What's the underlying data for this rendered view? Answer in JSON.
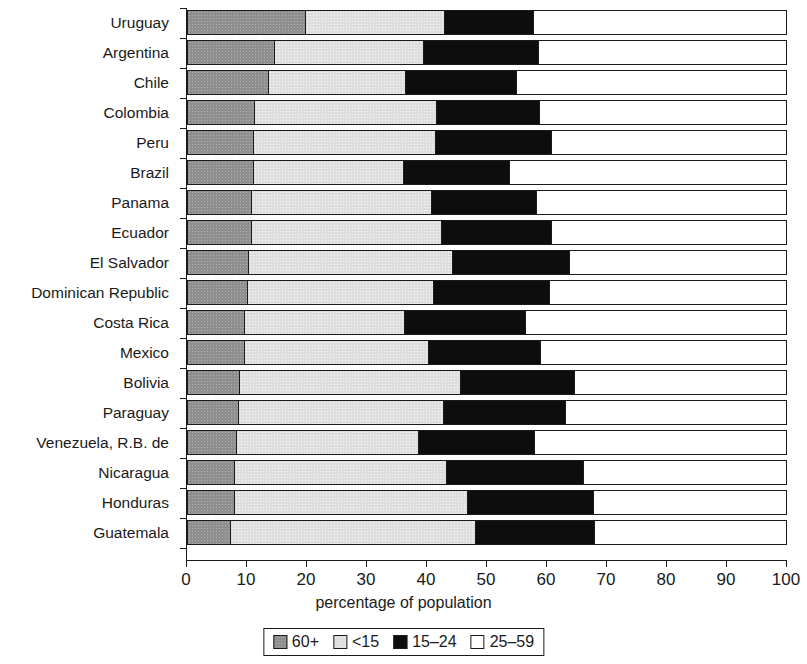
{
  "chart_data": {
    "type": "bar",
    "orientation": "horizontal",
    "stacked": true,
    "title": "",
    "xlabel": "percentage of population",
    "ylabel": "",
    "xlim": [
      0,
      100
    ],
    "xticks": [
      0,
      10,
      20,
      30,
      40,
      50,
      60,
      70,
      80,
      90,
      100
    ],
    "grid": false,
    "legend_position": "bottom",
    "categories": [
      "Uruguay",
      "Argentina",
      "Chile",
      "Colombia",
      "Peru",
      "Brazil",
      "Panama",
      "Ecuador",
      "El Salvador",
      "Dominican Republic",
      "Costa Rica",
      "Mexico",
      "Bolivia",
      "Paraguay",
      "Venezuela, R.B. de",
      "Nicaragua",
      "Honduras",
      "Guatemala"
    ],
    "series": [
      {
        "name": "60+",
        "color": "#8f8f8f",
        "values": [
          19.5,
          14.3,
          13.3,
          11.0,
          10.8,
          10.8,
          10.5,
          10.5,
          10.0,
          9.8,
          9.3,
          9.3,
          8.5,
          8.3,
          8.0,
          7.7,
          7.7,
          7.0
        ]
      },
      {
        "name": "<15",
        "color": "#dedede",
        "values": [
          23.2,
          24.9,
          22.9,
          30.3,
          30.4,
          25.0,
          30.0,
          31.7,
          34.0,
          31.0,
          26.7,
          30.7,
          36.8,
          34.2,
          30.3,
          35.3,
          38.8,
          40.8
        ]
      },
      {
        "name": "15-24",
        "color": "#0d0d0d",
        "values": [
          14.8,
          19.1,
          18.5,
          17.2,
          19.3,
          17.7,
          17.5,
          18.3,
          19.5,
          19.4,
          20.2,
          18.7,
          19.0,
          20.3,
          19.4,
          22.8,
          21.0,
          19.9
        ]
      },
      {
        "name": "25-59",
        "color": "#ffffff",
        "values": [
          42.5,
          41.7,
          45.3,
          41.5,
          39.5,
          46.5,
          42.0,
          39.5,
          36.5,
          39.8,
          43.8,
          41.3,
          35.7,
          37.2,
          42.3,
          34.2,
          32.5,
          32.3
        ]
      }
    ]
  },
  "legend": {
    "items": [
      {
        "label": "60+",
        "swatch": "swatch-60-plus"
      },
      {
        "label": "<15",
        "swatch": "swatch-under-15"
      },
      {
        "label": "15–24",
        "swatch": "swatch-15-24"
      },
      {
        "label": "25–59",
        "swatch": "swatch-25-59"
      }
    ]
  }
}
